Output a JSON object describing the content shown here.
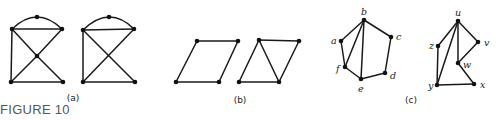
{
  "caption": "FIGURE 10",
  "panels": [
    {
      "id": "a",
      "label": "(a)",
      "label_pos": [
        73,
        101
      ],
      "graphs": [
        {
          "vertices": [
            {
              "id": "TL",
              "x": 12,
              "y": 29
            },
            {
              "id": "TR",
              "x": 62,
              "y": 29
            },
            {
              "id": "TOP",
              "x": 37,
              "y": 17
            },
            {
              "id": "C",
              "x": 37,
              "y": 56
            },
            {
              "id": "BL",
              "x": 11,
              "y": 82
            },
            {
              "id": "BR",
              "x": 63,
              "y": 82
            }
          ],
          "edges": [
            [
              "TL",
              "TR"
            ],
            [
              "TL",
              "BL"
            ],
            [
              "BL",
              "BR"
            ],
            [
              "TL",
              "C"
            ],
            [
              "C",
              "BR"
            ],
            [
              "TR",
              "C"
            ],
            [
              "C",
              "BL"
            ]
          ],
          "arcs": [
            {
              "from": "TL",
              "via": "TOP",
              "to": "TR"
            }
          ]
        },
        {
          "vertices": [
            {
              "id": "TL",
              "x": 83,
              "y": 30
            },
            {
              "id": "TR",
              "x": 134,
              "y": 29
            },
            {
              "id": "TOP",
              "x": 109,
              "y": 17
            },
            {
              "id": "BL",
              "x": 83,
              "y": 82
            },
            {
              "id": "BR",
              "x": 135,
              "y": 82
            }
          ],
          "edges": [
            [
              "TL",
              "TR"
            ],
            [
              "TL",
              "BL"
            ],
            [
              "BL",
              "BR"
            ],
            [
              "TL",
              "BR"
            ],
            [
              "TR",
              "BL"
            ]
          ],
          "arcs": [
            {
              "from": "TL",
              "via": "TOP",
              "to": "TR"
            }
          ]
        }
      ]
    },
    {
      "id": "b",
      "label": "(b)",
      "label_pos": [
        240,
        103
      ],
      "graphs": [
        {
          "vertices": [
            {
              "id": "TL",
              "x": 197,
              "y": 41
            },
            {
              "id": "TR",
              "x": 238,
              "y": 41
            },
            {
              "id": "BR",
              "x": 219,
              "y": 82
            },
            {
              "id": "BL",
              "x": 176,
              "y": 82
            }
          ],
          "edges": [
            [
              "TL",
              "TR"
            ],
            [
              "TR",
              "BR"
            ],
            [
              "BR",
              "BL"
            ],
            [
              "BL",
              "TL"
            ]
          ],
          "arcs": []
        },
        {
          "vertices": [
            {
              "id": "TL",
              "x": 259,
              "y": 40
            },
            {
              "id": "TR",
              "x": 299,
              "y": 41
            },
            {
              "id": "BR",
              "x": 279,
              "y": 82
            },
            {
              "id": "BL",
              "x": 239,
              "y": 82
            }
          ],
          "edges": [
            [
              "TL",
              "TR"
            ],
            [
              "TR",
              "BR"
            ],
            [
              "BR",
              "BL"
            ],
            [
              "BL",
              "TL"
            ],
            [
              "TL",
              "BR"
            ]
          ],
          "arcs": []
        }
      ]
    },
    {
      "id": "c",
      "label": "(c)",
      "label_pos": [
        411,
        103
      ],
      "graphs": [
        {
          "vertices": [
            {
              "id": "b",
              "label": "b",
              "x": 364,
              "y": 20,
              "lx": 361,
              "ly": 15
            },
            {
              "id": "a",
              "label": "a",
              "x": 341,
              "y": 41,
              "lx": 331,
              "ly": 44
            },
            {
              "id": "c",
              "label": "c",
              "x": 391,
              "y": 37,
              "lx": 396,
              "ly": 40
            },
            {
              "id": "f",
              "label": "f",
              "x": 345,
              "y": 67,
              "lx": 336,
              "ly": 72
            },
            {
              "id": "e",
              "label": "e",
              "x": 361,
              "y": 79,
              "lx": 358,
              "ly": 92
            },
            {
              "id": "d",
              "label": "d",
              "x": 385,
              "y": 73,
              "lx": 390,
              "ly": 79
            }
          ],
          "edges": [
            [
              "a",
              "b"
            ],
            [
              "b",
              "c"
            ],
            [
              "c",
              "d"
            ],
            [
              "d",
              "e"
            ],
            [
              "e",
              "f"
            ],
            [
              "f",
              "a"
            ],
            [
              "b",
              "f"
            ],
            [
              "b",
              "e"
            ]
          ],
          "arcs": []
        },
        {
          "vertices": [
            {
              "id": "u",
              "label": "u",
              "x": 458,
              "y": 21,
              "lx": 455,
              "ly": 16
            },
            {
              "id": "z",
              "label": "z",
              "x": 438,
              "y": 46,
              "lx": 429,
              "ly": 49
            },
            {
              "id": "v",
              "label": "v",
              "x": 478,
              "y": 42,
              "lx": 484,
              "ly": 46
            },
            {
              "id": "w",
              "label": "w",
              "x": 458,
              "y": 63,
              "lx": 463,
              "ly": 68
            },
            {
              "id": "y",
              "label": "y",
              "x": 437,
              "y": 85,
              "lx": 428,
              "ly": 89
            },
            {
              "id": "x",
              "label": "x",
              "x": 474,
              "y": 84,
              "lx": 480,
              "ly": 88
            }
          ],
          "edges": [
            [
              "u",
              "z"
            ],
            [
              "z",
              "y"
            ],
            [
              "u",
              "y"
            ],
            [
              "u",
              "v"
            ],
            [
              "v",
              "w"
            ],
            [
              "u",
              "w"
            ],
            [
              "w",
              "x"
            ],
            [
              "y",
              "x"
            ]
          ],
          "arcs": []
        }
      ]
    }
  ]
}
